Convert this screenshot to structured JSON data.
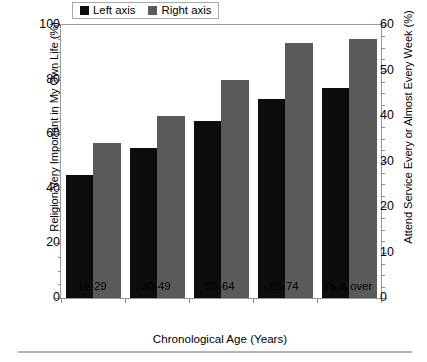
{
  "chart_data": {
    "type": "bar",
    "title": "",
    "xlabel": "Chronological Age (Years)",
    "ylabel": "Religion Very Important in My Own Life (%)",
    "ylabel_right": "Attend Service Every or Almost Every Week (%)",
    "categories": [
      "18-29",
      "30-49",
      "50-64",
      "65-74",
      "75 & over"
    ],
    "series": [
      {
        "name": "Left axis",
        "axis": "left",
        "color": "#0d0d0d",
        "values": [
          45,
          55,
          65,
          73,
          77
        ]
      },
      {
        "name": "Right axis",
        "axis": "right",
        "color": "#5a5a5a",
        "values": [
          34,
          40,
          48,
          56,
          57
        ]
      }
    ],
    "ylim": [
      0,
      100
    ],
    "ylim_right": [
      0,
      60
    ],
    "yticks": [
      0,
      20,
      40,
      60,
      80,
      100
    ],
    "yticks_right": [
      0,
      10,
      20,
      30,
      40,
      50,
      60
    ],
    "yticks_minor_step": 5,
    "yticks_right_minor_step": 2.5,
    "grid": false,
    "legend_position": "top-center",
    "legend": [
      "Left axis",
      "Right axis"
    ]
  },
  "axes": {
    "left": {
      "title": "Religion Very Important in My Own Life (%)",
      "tick_labels": [
        "0",
        "20",
        "40",
        "60",
        "80",
        "100"
      ]
    },
    "right": {
      "title": "Attend Service Every or Almost Every Week (%)",
      "tick_labels": [
        "0",
        "10",
        "20",
        "30",
        "40",
        "50",
        "60"
      ]
    },
    "x": {
      "title": "Chronological Age (Years)",
      "tick_labels": [
        "18-29",
        "30-49",
        "50-64",
        "65-74",
        "75 & over"
      ]
    }
  },
  "legend": {
    "items": [
      {
        "label": "Left axis",
        "color": "#0d0d0d"
      },
      {
        "label": "Right axis",
        "color": "#5a5a5a"
      }
    ]
  },
  "colors": {
    "left_series": "#0d0d0d",
    "right_series": "#5a5a5a",
    "frame": "#9a9a9a",
    "background": "#ffffff",
    "rule": "#b4b4b4"
  }
}
